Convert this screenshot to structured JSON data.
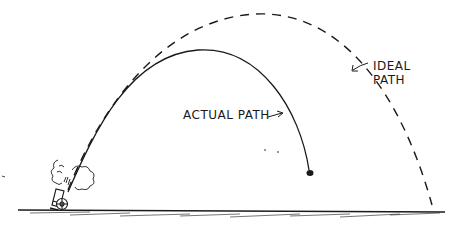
{
  "diagram": {
    "title": "",
    "labels": {
      "ideal_path_line1": "IDEAL",
      "ideal_path_line2": "PATH",
      "actual_path": "ACTUAL PATH"
    },
    "elements": [
      {
        "name": "cannon",
        "description": "small cannon on wheels firing with smoke puffs"
      },
      {
        "name": "ideal-path",
        "style": "dashed",
        "description": "symmetric parabolic trajectory landing far right"
      },
      {
        "name": "actual-path",
        "style": "solid",
        "description": "shorter trajectory falling steeply, ending at ball"
      },
      {
        "name": "cannonball",
        "description": "ball at end of actual path"
      },
      {
        "name": "ground",
        "description": "hatched ground line"
      }
    ],
    "colors": {
      "ink": "#1a1a1a",
      "background": "#ffffff"
    }
  }
}
